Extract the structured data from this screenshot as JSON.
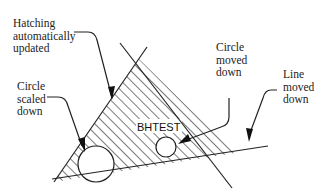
{
  "diagram": {
    "colors": {
      "stroke": "#222222",
      "background": "#ffffff"
    },
    "labels": [
      {
        "id": "hatching",
        "lines": [
          "Hatching",
          "automatically",
          "updated"
        ]
      },
      {
        "id": "circle-scaled",
        "lines": [
          "Circle",
          "scaled",
          "down"
        ]
      },
      {
        "id": "circle-moved",
        "lines": [
          "Circle",
          "moved",
          "down"
        ]
      },
      {
        "id": "line-moved",
        "lines": [
          "Line",
          "moved",
          "down"
        ]
      }
    ],
    "hatch_label": "BHTEST"
  }
}
